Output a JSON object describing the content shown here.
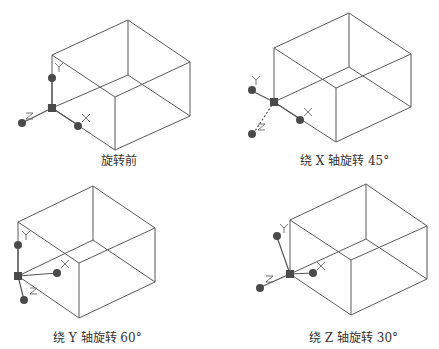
{
  "figure": {
    "panels": [
      {
        "id": "before",
        "caption": "旋转前"
      },
      {
        "id": "rotate-x",
        "caption": "绕 X 轴旋转 45°"
      },
      {
        "id": "rotate-y",
        "caption": "绕 Y 轴旋转 60°"
      },
      {
        "id": "rotate-z",
        "caption": "绕 Z 轴旋转 30°"
      }
    ],
    "axis_labels": {
      "x": "X",
      "y": "Y",
      "z": "Z"
    },
    "colors": {
      "edge": "#5a5a5a",
      "grip": "#4a4a4a",
      "background": "#ffffff"
    }
  }
}
